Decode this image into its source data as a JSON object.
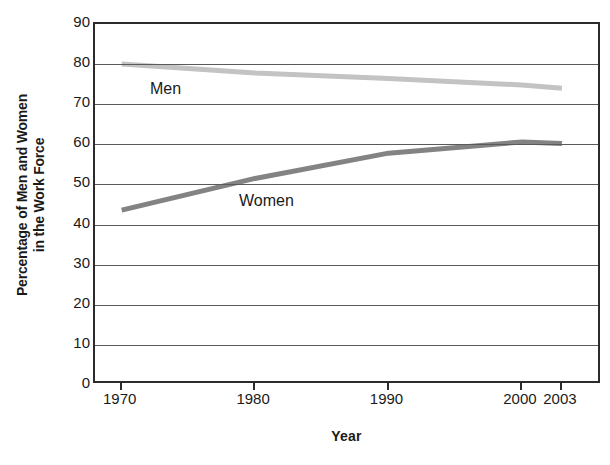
{
  "chart_data": {
    "type": "line",
    "title": "",
    "xlabel": "Year",
    "ylabel": "Percentage of Men and Women in the Work Force",
    "ylabel_line1": "Percentage of Men and Women",
    "ylabel_line2": "in the Work Force",
    "xlim": [
      1968,
      2006
    ],
    "ylim": [
      0,
      90
    ],
    "ytick_labels": [
      "90",
      "80",
      "70",
      "60",
      "50",
      "40",
      "30",
      "20",
      "10",
      "0"
    ],
    "ytick_values": [
      90,
      80,
      70,
      60,
      50,
      40,
      30,
      20,
      10,
      0
    ],
    "xtick_labels": [
      "1970",
      "1980",
      "1990",
      "2000",
      "2003"
    ],
    "xtick_values": [
      1970,
      1980,
      1990,
      2000,
      2003
    ],
    "grid": "horizontal",
    "legend": "inline-labels",
    "x": [
      1970,
      1980,
      1990,
      2000,
      2003
    ],
    "series": [
      {
        "name": "Men",
        "label": "Men",
        "color": "#c3c3c3",
        "values": [
          80.0,
          77.8,
          76.4,
          74.8,
          74.0
        ]
      },
      {
        "name": "Women",
        "label": "Women",
        "color": "#838383",
        "values": [
          43.6,
          51.5,
          57.8,
          60.6,
          60.2
        ]
      }
    ]
  },
  "axes": {
    "frame_color": "#2b2b2b",
    "gridline_color": "#5a5a5a",
    "background": "#ffffff"
  }
}
